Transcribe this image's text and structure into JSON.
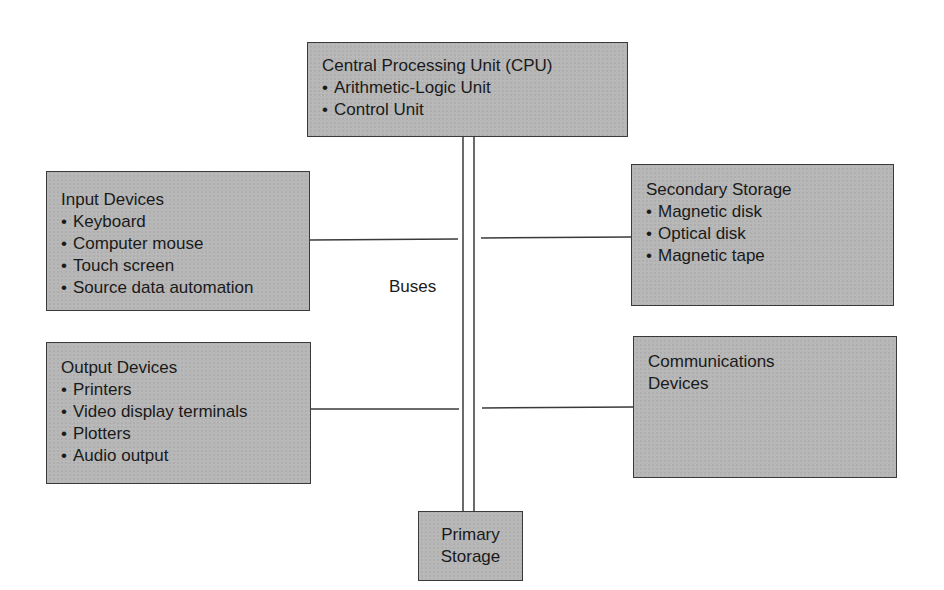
{
  "diagram": {
    "type": "computer-system-block-diagram",
    "nodes": {
      "cpu": {
        "title": "Central Processing Unit (CPU)",
        "items": [
          "Arithmetic-Logic Unit",
          "Control Unit"
        ]
      },
      "input": {
        "title": "Input Devices",
        "items": [
          "Keyboard",
          "Computer mouse",
          "Touch screen",
          "Source data automation"
        ]
      },
      "secondary": {
        "title": "Secondary Storage",
        "items": [
          "Magnetic disk",
          "Optical disk",
          "Magnetic tape"
        ]
      },
      "output": {
        "title": "Output Devices",
        "items": [
          "Printers",
          "Video display terminals",
          "Plotters",
          "Audio output"
        ]
      },
      "communications": {
        "title_line1": "Communications",
        "title_line2": "Devices"
      },
      "primary": {
        "title_line1": "Primary",
        "title_line2": "Storage"
      }
    },
    "bus_label": "Buses",
    "edges": [
      {
        "from": "cpu",
        "to": "primary",
        "via": "bus"
      },
      {
        "from": "input",
        "to": "bus"
      },
      {
        "from": "secondary",
        "to": "bus"
      },
      {
        "from": "output",
        "to": "bus"
      },
      {
        "from": "communications",
        "to": "bus"
      }
    ],
    "colors": {
      "box_fill": "#b7b7b7",
      "box_border": "#3a3a3a",
      "line": "#3a3a3a",
      "text": "#1a1a1a",
      "background": "#ffffff"
    }
  }
}
